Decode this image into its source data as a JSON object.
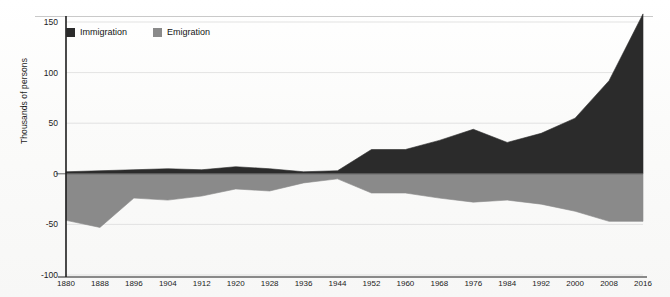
{
  "chart_data": {
    "type": "area",
    "title": "",
    "xlabel": "",
    "ylabel": "Thousands of persons",
    "grid": true,
    "legend_position": "top-left",
    "xlim": [
      1880,
      2016
    ],
    "ylim": [
      -100,
      150
    ],
    "yticks": [
      150,
      100,
      50,
      0,
      -50,
      -100
    ],
    "categories": [
      1880,
      1888,
      1896,
      1904,
      1912,
      1920,
      1928,
      1936,
      1944,
      1952,
      1960,
      1968,
      1976,
      1984,
      1992,
      2000,
      2008,
      2016
    ],
    "xticklabels": [
      "1880",
      "1888",
      "1896",
      "1904",
      "1912",
      "1920",
      "1928",
      "1936",
      "1944",
      "1952",
      "1960",
      "1968",
      "1976",
      "1984",
      "1992",
      "2000",
      "2008",
      "2016"
    ],
    "yticklabels": [
      "150",
      "100",
      "50",
      "0",
      "-50",
      "-100"
    ],
    "series": [
      {
        "name": "Immigration",
        "color": "#2b2b2b",
        "values": [
          2,
          3,
          4,
          5,
          4,
          7,
          5,
          2,
          3,
          24,
          24,
          33,
          44,
          31,
          40,
          55,
          92,
          158
        ]
      },
      {
        "name": "Emigration",
        "color": "#8a8a8a",
        "values": [
          -46,
          -53,
          -24,
          -26,
          -22,
          -15,
          -17,
          -9,
          -5,
          -19,
          -19,
          -24,
          -28,
          -26,
          -30,
          -37,
          -47,
          -47
        ]
      }
    ]
  },
  "legend": {
    "items": [
      {
        "label": "Immigration",
        "color": "#2b2b2b"
      },
      {
        "label": "Emigration",
        "color": "#8a8a8a"
      }
    ]
  },
  "axis": {
    "y_title": "Thousands of persons"
  }
}
